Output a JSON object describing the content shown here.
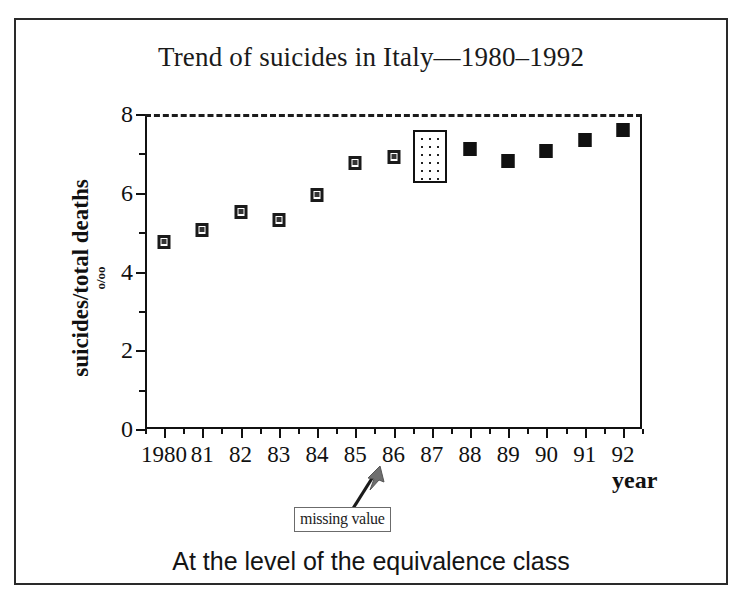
{
  "figure": {
    "title": "Trend of suicides in Italy—1980–1992",
    "caption": "At the level of the equivalence class"
  },
  "annotation": {
    "label": "missing value",
    "arrow_icon": "arrow-up-right-icon"
  },
  "chart_data": {
    "type": "scatter",
    "title": "Trend of suicides in Italy—1980–1992",
    "xlabel": "year",
    "ylabel": "suicides/total deaths",
    "ylabel_units": "o/oo",
    "xlim": [
      1979.5,
      1992.5
    ],
    "ylim": [
      0,
      8
    ],
    "yticks": [
      0,
      2,
      4,
      6,
      8
    ],
    "yticks_minor": [
      1,
      3,
      5,
      7
    ],
    "grid": false,
    "legend": null,
    "reference_line": {
      "y": 8,
      "style": "dashed",
      "label": ""
    },
    "highlight_region": {
      "label": "missing value",
      "x_start": 1986.5,
      "x_end": 1987.4,
      "y_start": 6.25,
      "y_end": 7.6,
      "style": "dotted-fill"
    },
    "categories": [
      1980,
      1981,
      1982,
      1983,
      1984,
      1985,
      1986,
      1987,
      1988,
      1989,
      1990,
      1991,
      1992
    ],
    "tick_labels": [
      "1980",
      "81",
      "82",
      "83",
      "84",
      "85",
      "86",
      "87",
      "88",
      "89",
      "90",
      "91",
      "92"
    ],
    "values": [
      4.75,
      5.05,
      5.5,
      5.3,
      5.95,
      6.75,
      6.9,
      null,
      7.1,
      6.8,
      7.05,
      7.35,
      7.6
    ],
    "marker_styles": [
      "open",
      "open",
      "open",
      "open",
      "open",
      "open",
      "open",
      null,
      "filled",
      "filled",
      "filled",
      "filled",
      "filled"
    ],
    "points": [
      {
        "year": 1980,
        "label": "1980",
        "value": 4.75,
        "marker": "open"
      },
      {
        "year": 1981,
        "label": "81",
        "value": 5.05,
        "marker": "open"
      },
      {
        "year": 1982,
        "label": "82",
        "value": 5.5,
        "marker": "open"
      },
      {
        "year": 1983,
        "label": "83",
        "value": 5.3,
        "marker": "open"
      },
      {
        "year": 1984,
        "label": "84",
        "value": 5.95,
        "marker": "open"
      },
      {
        "year": 1985,
        "label": "85",
        "value": 6.75,
        "marker": "open"
      },
      {
        "year": 1986,
        "label": "86",
        "value": 6.9,
        "marker": "open"
      },
      {
        "year": 1987,
        "label": "87",
        "value": null,
        "marker": "missing"
      },
      {
        "year": 1988,
        "label": "88",
        "value": 7.1,
        "marker": "filled"
      },
      {
        "year": 1989,
        "label": "89",
        "value": 6.8,
        "marker": "filled"
      },
      {
        "year": 1990,
        "label": "90",
        "value": 7.05,
        "marker": "filled"
      },
      {
        "year": 1991,
        "label": "91",
        "value": 7.35,
        "marker": "filled"
      },
      {
        "year": 1992,
        "label": "92",
        "value": 7.6,
        "marker": "filled"
      }
    ]
  },
  "colors": {
    "frame": "#2a2a2a",
    "axis": "#111111",
    "marker": "#111111",
    "arrow": "#6e6e6e",
    "background": "#ffffff"
  }
}
